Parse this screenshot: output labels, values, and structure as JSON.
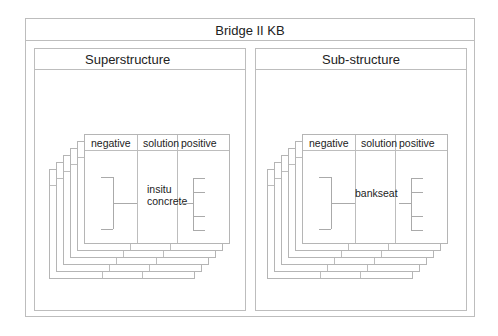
{
  "diagram": {
    "title": "Bridge II KB",
    "panels": [
      {
        "title": "Superstructure",
        "card": {
          "columns": [
            "negative",
            "solution",
            "positive"
          ],
          "solution_lines": [
            "insitu",
            "concrete"
          ],
          "negative_branches": 2,
          "positive_branches": 4
        },
        "stack_depth": 6
      },
      {
        "title": "Sub-structure",
        "card": {
          "columns": [
            "negative",
            "solution",
            "positive"
          ],
          "solution_lines": [
            "bankseat"
          ],
          "negative_branches": 2,
          "positive_branches": 4
        },
        "stack_depth": 6
      }
    ],
    "colors": {
      "line": "#bdbdbd",
      "text": "#222222",
      "background": "#ffffff"
    }
  }
}
